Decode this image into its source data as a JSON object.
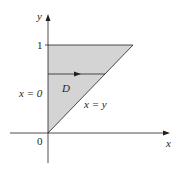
{
  "diagram": {
    "axes": {
      "x_label": "x",
      "y_label": "y",
      "origin_label": "0",
      "y_tick_label": "1"
    },
    "region": {
      "label": "D",
      "fill": "#d4d4d4"
    },
    "boundaries": {
      "left": "x = 0",
      "hypotenuse": "x = y"
    },
    "colors": {
      "line": "#231f20",
      "region": "#d4d4d4"
    }
  }
}
